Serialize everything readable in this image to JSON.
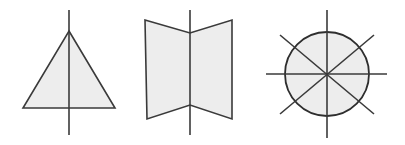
{
  "diagram": {
    "canvas": {
      "width": 405,
      "height": 145,
      "background": "#ffffff"
    },
    "style": {
      "fill_color": "#ededed",
      "stroke_color": "#3a3a3a",
      "circle_stroke_color": "#2e2e2e",
      "stroke_width": 1.6
    },
    "figures": [
      {
        "id": "figure-1",
        "name": "triangle-with-vertical-axis",
        "shape": "triangle",
        "axes_of_symmetry": 1,
        "polygon_points": "69,31 115,108 23,108",
        "axis_lines": [
          {
            "name": "vertical-axis",
            "x1": 69,
            "y1": 10,
            "x2": 69,
            "y2": 135
          }
        ]
      },
      {
        "id": "figure-2",
        "name": "folded-screen-with-vertical-axis",
        "shape": "concave-hexagon",
        "axes_of_symmetry": 1,
        "polygon_points": "145,20 190,33 232,20 232,119 190,105 147,119",
        "axis_lines": [
          {
            "name": "vertical-axis",
            "x1": 190,
            "y1": 10,
            "x2": 190,
            "y2": 135
          }
        ]
      },
      {
        "id": "figure-3",
        "name": "circle-with-four-axes",
        "shape": "circle",
        "axes_of_symmetry": 4,
        "circle": {
          "cx": 327,
          "cy": 74,
          "r": 42
        },
        "axis_lines": [
          {
            "name": "vertical-axis",
            "x1": 327,
            "y1": 10,
            "x2": 327,
            "y2": 138
          },
          {
            "name": "horizontal-axis",
            "x1": 266,
            "y1": 74,
            "x2": 387,
            "y2": 74
          },
          {
            "name": "diagonal-axis-nw-se",
            "x1": 280,
            "y1": 35,
            "x2": 374,
            "y2": 114
          },
          {
            "name": "diagonal-axis-ne-sw",
            "x1": 374,
            "y1": 35,
            "x2": 280,
            "y2": 114
          }
        ]
      }
    ]
  }
}
